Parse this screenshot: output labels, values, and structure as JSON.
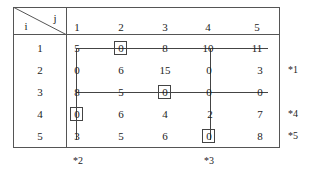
{
  "header": {
    "row_label": "i",
    "col_label": "j"
  },
  "columns": [
    "1",
    "2",
    "3",
    "4",
    "5"
  ],
  "rows": [
    {
      "i": "1",
      "values": [
        "5",
        "0",
        "8",
        "10",
        "11"
      ]
    },
    {
      "i": "2",
      "values": [
        "0",
        "6",
        "15",
        "0",
        "3"
      ]
    },
    {
      "i": "3",
      "values": [
        "8",
        "5",
        "0",
        "0",
        "0"
      ]
    },
    {
      "i": "4",
      "values": [
        "0",
        "6",
        "4",
        "2",
        "7"
      ]
    },
    {
      "i": "5",
      "values": [
        "3",
        "5",
        "6",
        "0",
        "8"
      ]
    }
  ],
  "row_marks": {
    "r2": "*1",
    "r4": "*4",
    "r5": "*5"
  },
  "col_marks": {
    "c1": "*2",
    "c4": "*3"
  },
  "boxed_zeros": [
    [
      1,
      2
    ],
    [
      3,
      3
    ],
    [
      4,
      1
    ],
    [
      5,
      4
    ]
  ]
}
